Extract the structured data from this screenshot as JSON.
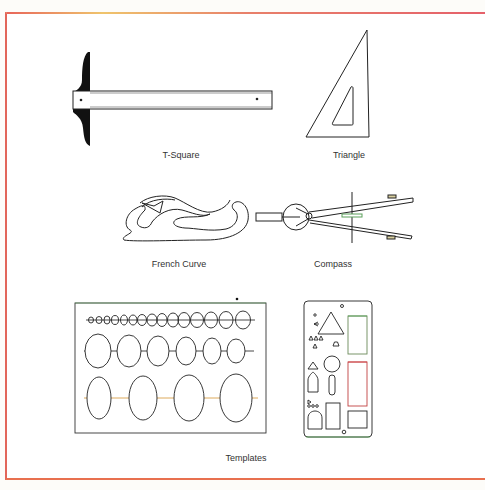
{
  "figure": {
    "items": [
      {
        "id": "t-square",
        "label": "T-Square"
      },
      {
        "id": "triangle",
        "label": "Triangle"
      },
      {
        "id": "french-curve",
        "label": "French Curve"
      },
      {
        "id": "compass",
        "label": "Compass"
      },
      {
        "id": "templates",
        "label": "Templates"
      }
    ],
    "colors": {
      "frame": "#e2665a",
      "ink": "#222222",
      "accent_green": "#5aa05a",
      "accent_red": "#d0454a",
      "accent_orange": "#d9a04a"
    }
  }
}
